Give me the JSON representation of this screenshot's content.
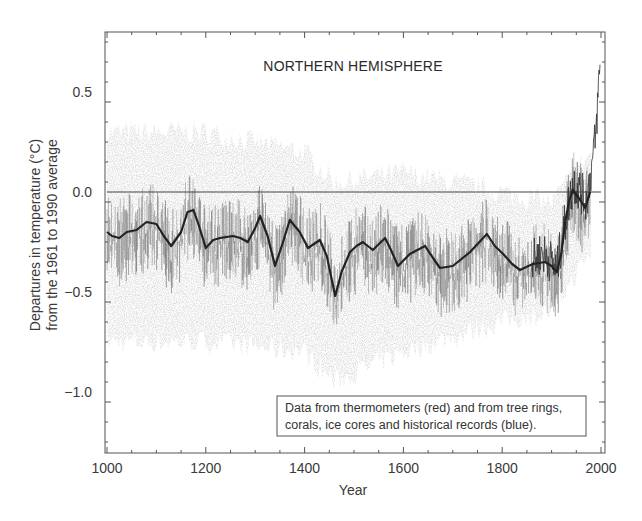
{
  "chart_data": {
    "type": "line",
    "title": "NORTHERN HEMISPHERE",
    "xlabel": "Year",
    "ylabel_line1": "Departures in temperature (°C)",
    "ylabel_line2": "from the 1961 to 1990 average",
    "xlim": [
      1000,
      2000
    ],
    "ylim": [
      -1.3,
      0.8
    ],
    "x_ticks": [
      1000,
      1200,
      1400,
      1600,
      1800,
      2000
    ],
    "x_tick_labels": [
      "1000",
      "1200",
      "1400",
      "1600",
      "1800",
      "2000"
    ],
    "y_ticks": [
      0.5,
      0.0,
      -0.5,
      -1.0
    ],
    "y_tick_labels": [
      "0.5",
      "0.0",
      "−0.5",
      "−1.0"
    ],
    "grid": false,
    "reference_line": 0.0,
    "legend": {
      "position": "lower right",
      "line1": "Data from thermometers (red) and from tree rings,",
      "line2": "corals, ice cores and historical records (blue)."
    },
    "series": [
      {
        "name": "Smoothed reconstruction (50-year)",
        "style": "solid dark line",
        "x": [
          1000,
          1010,
          1025,
          1040,
          1060,
          1080,
          1100,
          1115,
          1130,
          1150,
          1163,
          1175,
          1185,
          1200,
          1215,
          1229,
          1255,
          1270,
          1285,
          1300,
          1310,
          1325,
          1340,
          1355,
          1370,
          1390,
          1407,
          1431,
          1445,
          1462,
          1475,
          1492,
          1505,
          1518,
          1538,
          1563,
          1575,
          1589,
          1613,
          1644,
          1660,
          1674,
          1700,
          1720,
          1735,
          1750,
          1769,
          1785,
          1802,
          1820,
          1836,
          1862,
          1887,
          1900,
          1911,
          1920,
          1927,
          1935,
          1943,
          1955,
          1968,
          1978
        ],
        "values": [
          -0.2,
          -0.22,
          -0.23,
          -0.2,
          -0.19,
          -0.15,
          -0.16,
          -0.22,
          -0.27,
          -0.2,
          -0.1,
          -0.09,
          -0.16,
          -0.28,
          -0.24,
          -0.23,
          -0.22,
          -0.23,
          -0.25,
          -0.18,
          -0.12,
          -0.22,
          -0.37,
          -0.26,
          -0.14,
          -0.2,
          -0.28,
          -0.24,
          -0.32,
          -0.52,
          -0.4,
          -0.3,
          -0.27,
          -0.25,
          -0.29,
          -0.23,
          -0.29,
          -0.37,
          -0.31,
          -0.27,
          -0.33,
          -0.38,
          -0.37,
          -0.33,
          -0.3,
          -0.26,
          -0.21,
          -0.27,
          -0.31,
          -0.36,
          -0.39,
          -0.36,
          -0.35,
          -0.37,
          -0.4,
          -0.3,
          -0.16,
          -0.05,
          0.01,
          -0.03,
          -0.08,
          0.0
        ]
      },
      {
        "name": "Thermometer record (red)",
        "style": "noisy dark line, instrumental era",
        "x": [
          1860,
          1880,
          1900,
          1910,
          1920,
          1935,
          1945,
          1960,
          1970,
          1980,
          1990,
          1998
        ],
        "values": [
          -0.35,
          -0.3,
          -0.35,
          -0.4,
          -0.25,
          -0.05,
          0.05,
          0.0,
          -0.05,
          0.1,
          0.3,
          0.65
        ]
      },
      {
        "name": "Proxy records (blue)",
        "style": "light grey uncertainty band around annual values",
        "x": [
          1000,
          1200,
          1400,
          1460,
          1600,
          1800,
          1900,
          1980
        ],
        "upper": [
          0.3,
          0.3,
          0.2,
          0.05,
          0.1,
          0.0,
          -0.05,
          0.2
        ],
        "lower": [
          -0.75,
          -0.75,
          -0.8,
          -0.95,
          -0.8,
          -0.65,
          -0.6,
          -0.3
        ]
      }
    ]
  }
}
